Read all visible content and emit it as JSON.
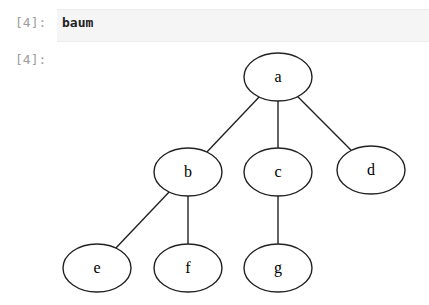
{
  "cell": {
    "input_prompt": "[4]:",
    "output_prompt": "[4]:",
    "code": "baum"
  },
  "tree": {
    "nodes": [
      {
        "id": "a",
        "label": "a",
        "cx": 278,
        "cy": 77
      },
      {
        "id": "b",
        "label": "b",
        "cx": 188,
        "cy": 172
      },
      {
        "id": "c",
        "label": "c",
        "cx": 278,
        "cy": 172
      },
      {
        "id": "d",
        "label": "d",
        "cx": 371,
        "cy": 170
      },
      {
        "id": "e",
        "label": "e",
        "cx": 97,
        "cy": 268
      },
      {
        "id": "f",
        "label": "f",
        "cx": 188,
        "cy": 268
      },
      {
        "id": "g",
        "label": "g",
        "cx": 278,
        "cy": 268
      }
    ],
    "edges": [
      [
        "a",
        "b"
      ],
      [
        "a",
        "c"
      ],
      [
        "a",
        "d"
      ],
      [
        "b",
        "e"
      ],
      [
        "b",
        "f"
      ],
      [
        "c",
        "g"
      ]
    ]
  }
}
